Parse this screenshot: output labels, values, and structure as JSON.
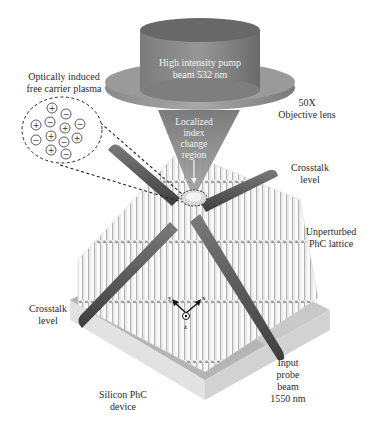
{
  "figure": {
    "labels": {
      "pump_beam_line1": "High intensity pump",
      "pump_beam_line2": "beam 532 nm",
      "objective_line1": "50X",
      "objective_line2": "Objective lens",
      "plasma_line1": "Optically induced",
      "plasma_line2": "free carrier plasma",
      "index_line1": "Localized",
      "index_line2": "index",
      "index_line3": "change",
      "index_line4": "region",
      "crosstalk_right_line1": "Crosstalk",
      "crosstalk_right_line2": "level",
      "unperturbed_line1": "Unperturbed",
      "unperturbed_line2": "PhC lattice",
      "crosstalk_left_line1": "Crosstalk",
      "crosstalk_left_line2": "level",
      "probe_line1": "Input",
      "probe_line2": "probe",
      "probe_line3": "beam",
      "probe_line4": "1550 nm",
      "device_line1": "Silicon PhC",
      "device_line2": "device"
    },
    "axes": {
      "x": "x",
      "y": "y",
      "z": "z"
    },
    "plasma_charges": [
      "+",
      "−",
      "−",
      "+",
      "−",
      "+",
      "−",
      "+",
      "−",
      "+",
      "−",
      "+",
      "−"
    ],
    "colors": {
      "lens_dark": "#6e6e6e",
      "lens_mid": "#8a8a8a",
      "lens_light": "#b4b4b4",
      "beam_cone": "#7a7a7a",
      "slab_top": "#c8c8c8",
      "slab_side": "#e4e4e4",
      "waveguide": "#5a5a5a",
      "pillar": "#f4f4f4",
      "pillar_shadow": "#9a9a9a",
      "dashed": "#222222",
      "text": "#2a2a2a"
    }
  }
}
